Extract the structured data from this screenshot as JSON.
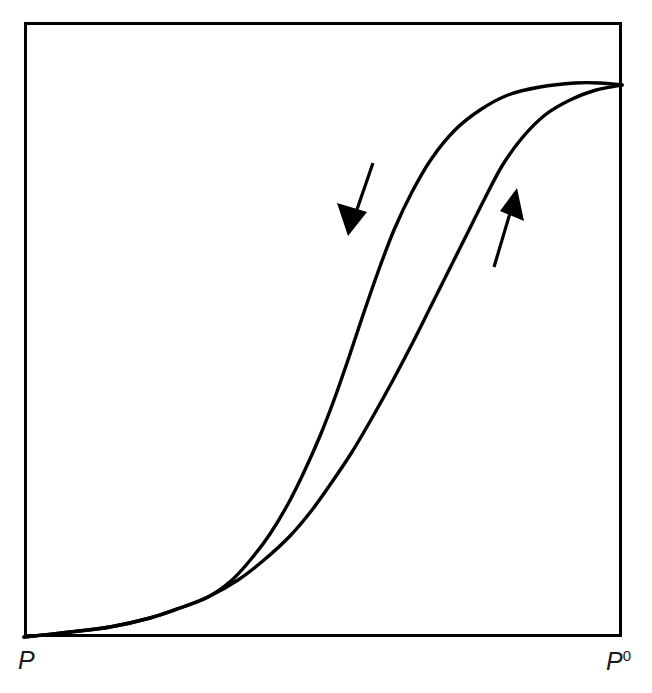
{
  "figure": {
    "kind": "hysteresis-loop-isotherm",
    "background_color": "#ffffff",
    "ink_color": "#000000",
    "frame": {
      "x": 24,
      "y": 22,
      "width": 598,
      "height": 615,
      "stroke_width": 3,
      "fill": "none"
    },
    "axis_labels": {
      "x_left": "P",
      "x_right_base": "P",
      "x_right_superscript": "0",
      "x_right_full": "P0"
    },
    "annotations": [
      {
        "name": "desorption-arrow",
        "label": "",
        "direction": "down-left",
        "tail_x": 373,
        "tail_y": 163,
        "head_x": 348,
        "head_y": 234
      },
      {
        "name": "adsorption-arrow",
        "label": "",
        "direction": "up-right",
        "tail_x": 494,
        "tail_y": 267,
        "head_x": 516,
        "head_y": 190
      }
    ]
  },
  "chart_data": {
    "type": "line",
    "title": "",
    "subtitle": "",
    "xlabel": "",
    "ylabel": "",
    "xlim": [
      0,
      1
    ],
    "ylim": [
      0,
      1
    ],
    "grid": false,
    "legend": null,
    "axis_tick_labels": {
      "x": [
        "P",
        "P0"
      ],
      "y": []
    },
    "series": [
      {
        "name": "desorption-branch",
        "stroke": "#000000",
        "stroke_width": 3.4,
        "points_px": [
          [
            24,
            637
          ],
          [
            70,
            632
          ],
          [
            110,
            627
          ],
          [
            150,
            618
          ],
          [
            180,
            608
          ],
          [
            208,
            597
          ],
          [
            232,
            580
          ],
          [
            252,
            558
          ],
          [
            270,
            534
          ],
          [
            288,
            504
          ],
          [
            304,
            472
          ],
          [
            320,
            436
          ],
          [
            334,
            400
          ],
          [
            348,
            360
          ],
          [
            362,
            318
          ],
          [
            378,
            272
          ],
          [
            394,
            230
          ],
          [
            412,
            192
          ],
          [
            432,
            158
          ],
          [
            455,
            130
          ],
          [
            480,
            110
          ],
          [
            508,
            95
          ],
          [
            540,
            87
          ],
          [
            575,
            83
          ],
          [
            600,
            83
          ],
          [
            622,
            85
          ]
        ]
      },
      {
        "name": "adsorption-branch",
        "stroke": "#000000",
        "stroke_width": 3.4,
        "points_px": [
          [
            24,
            637
          ],
          [
            70,
            632
          ],
          [
            110,
            627
          ],
          [
            150,
            618
          ],
          [
            180,
            608
          ],
          [
            208,
            597
          ],
          [
            238,
            580
          ],
          [
            264,
            560
          ],
          [
            290,
            536
          ],
          [
            312,
            510
          ],
          [
            332,
            482
          ],
          [
            352,
            452
          ],
          [
            372,
            418
          ],
          [
            392,
            382
          ],
          [
            412,
            344
          ],
          [
            430,
            308
          ],
          [
            448,
            272
          ],
          [
            466,
            236
          ],
          [
            484,
            200
          ],
          [
            502,
            166
          ],
          [
            522,
            138
          ],
          [
            545,
            115
          ],
          [
            570,
            100
          ],
          [
            596,
            90
          ],
          [
            622,
            85
          ]
        ]
      }
    ]
  }
}
